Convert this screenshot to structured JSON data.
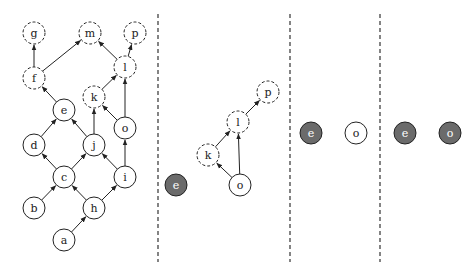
{
  "diagram": {
    "title": "",
    "panels": [
      {
        "id": "panel-1",
        "nodes": [
          {
            "id": "g",
            "label": "g",
            "x": 34,
            "y": 33,
            "style": "dashed"
          },
          {
            "id": "m",
            "label": "m",
            "x": 90,
            "y": 33,
            "style": "dashed"
          },
          {
            "id": "p",
            "label": "p",
            "x": 135,
            "y": 33,
            "style": "dashed"
          },
          {
            "id": "f",
            "label": "f",
            "x": 34,
            "y": 78,
            "style": "dashed"
          },
          {
            "id": "l",
            "label": "l",
            "x": 125,
            "y": 67,
            "style": "dashed"
          },
          {
            "id": "k",
            "label": "k",
            "x": 94,
            "y": 97,
            "style": "dashed"
          },
          {
            "id": "e",
            "label": "e",
            "x": 64,
            "y": 110,
            "style": "solid"
          },
          {
            "id": "o",
            "label": "o",
            "x": 125,
            "y": 128,
            "style": "solid"
          },
          {
            "id": "d",
            "label": "d",
            "x": 34,
            "y": 145,
            "style": "solid"
          },
          {
            "id": "j",
            "label": "j",
            "x": 94,
            "y": 145,
            "style": "solid"
          },
          {
            "id": "c",
            "label": "c",
            "x": 64,
            "y": 177,
            "style": "solid"
          },
          {
            "id": "i",
            "label": "i",
            "x": 125,
            "y": 177,
            "style": "solid"
          },
          {
            "id": "b",
            "label": "b",
            "x": 34,
            "y": 208,
            "style": "solid"
          },
          {
            "id": "h",
            "label": "h",
            "x": 94,
            "y": 208,
            "style": "solid"
          },
          {
            "id": "a",
            "label": "a",
            "x": 64,
            "y": 240,
            "style": "solid"
          }
        ],
        "edges": [
          {
            "from": "f",
            "to": "g"
          },
          {
            "from": "f",
            "to": "m"
          },
          {
            "from": "l",
            "to": "m"
          },
          {
            "from": "l",
            "to": "p"
          },
          {
            "from": "k",
            "to": "l"
          },
          {
            "from": "o",
            "to": "l"
          },
          {
            "from": "e",
            "to": "f"
          },
          {
            "from": "o",
            "to": "k"
          },
          {
            "from": "j",
            "to": "k"
          },
          {
            "from": "d",
            "to": "e"
          },
          {
            "from": "j",
            "to": "e"
          },
          {
            "from": "i",
            "to": "o"
          },
          {
            "from": "c",
            "to": "d"
          },
          {
            "from": "c",
            "to": "j"
          },
          {
            "from": "i",
            "to": "j"
          },
          {
            "from": "b",
            "to": "c"
          },
          {
            "from": "h",
            "to": "c"
          },
          {
            "from": "h",
            "to": "i"
          },
          {
            "from": "a",
            "to": "h"
          }
        ]
      },
      {
        "id": "panel-2",
        "nodes": [
          {
            "id": "e",
            "label": "e",
            "x": 176,
            "y": 185,
            "style": "filled"
          },
          {
            "id": "k",
            "label": "k",
            "x": 208,
            "y": 155,
            "style": "dashed"
          },
          {
            "id": "l",
            "label": "l",
            "x": 238,
            "y": 122,
            "style": "dashed"
          },
          {
            "id": "p",
            "label": "p",
            "x": 268,
            "y": 92,
            "style": "dashed"
          },
          {
            "id": "o",
            "label": "o",
            "x": 240,
            "y": 185,
            "style": "solid"
          }
        ],
        "edges": [
          {
            "from": "o",
            "to": "k"
          },
          {
            "from": "o",
            "to": "l"
          },
          {
            "from": "k",
            "to": "l"
          },
          {
            "from": "l",
            "to": "p"
          }
        ]
      },
      {
        "id": "panel-3",
        "nodes": [
          {
            "id": "e",
            "label": "e",
            "x": 311,
            "y": 133,
            "style": "filled"
          },
          {
            "id": "o",
            "label": "o",
            "x": 356,
            "y": 133,
            "style": "solid"
          }
        ],
        "edges": []
      },
      {
        "id": "panel-4",
        "nodes": [
          {
            "id": "e",
            "label": "e",
            "x": 405,
            "y": 133,
            "style": "filled"
          },
          {
            "id": "o",
            "label": "o",
            "x": 450,
            "y": 133,
            "style": "filled"
          }
        ],
        "edges": []
      }
    ],
    "separators": [
      {
        "x": 158,
        "y1": 14,
        "y2": 262
      },
      {
        "x": 290,
        "y1": 14,
        "y2": 262
      },
      {
        "x": 380,
        "y1": 14,
        "y2": 262
      }
    ],
    "node_radius": 11,
    "colors": {
      "stroke": "#222222",
      "filled_node": "#6b6b6b",
      "filled_label": "#ffffff",
      "separator": "#333333",
      "background": "#ffffff"
    }
  }
}
